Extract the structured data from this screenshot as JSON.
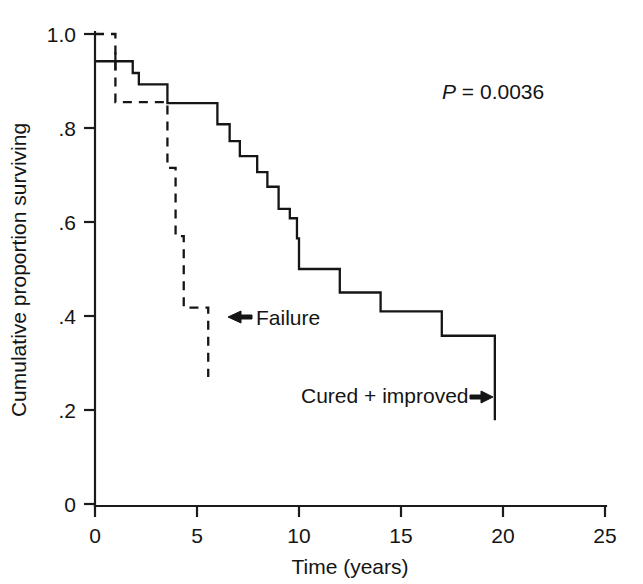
{
  "chart_data": {
    "type": "line",
    "subtype": "kaplan-meier-step",
    "title": "",
    "xlabel": "Time (years)",
    "ylabel": "Cumulative proportion surviving",
    "xlim": [
      0,
      25
    ],
    "ylim": [
      0,
      1.0
    ],
    "xticks": [
      0,
      5,
      10,
      15,
      20,
      25
    ],
    "xtick_labels": [
      "0",
      "5",
      "10",
      "15",
      "20",
      "25"
    ],
    "yticks": [
      0,
      0.2,
      0.4,
      0.6,
      0.8,
      1.0
    ],
    "ytick_labels": [
      "0",
      ".2",
      ".4",
      ".6",
      ".8",
      "1.0"
    ],
    "grid": false,
    "legend_position": "inline-annotations",
    "annotations": [
      {
        "name": "p-value",
        "text": "P = 0.0036",
        "italic_prefix": "P",
        "rest": " = 0.0036",
        "x": 16.4,
        "y": 0.885
      },
      {
        "name": "failure-label",
        "text": "Failure",
        "arrow": "left",
        "x": 7.3,
        "y": 0.415
      },
      {
        "name": "cured-improved-label",
        "text": "Cured + improved",
        "arrow": "right",
        "x": 14.6,
        "y": 0.235
      }
    ],
    "series": [
      {
        "name": "Cured + improved",
        "style": "solid",
        "color": "#151515",
        "steps": [
          {
            "t": 0.0,
            "s": 0.942
          },
          {
            "t": 1.85,
            "s": 0.942
          },
          {
            "t": 1.85,
            "s": 0.917
          },
          {
            "t": 2.15,
            "s": 0.917
          },
          {
            "t": 2.15,
            "s": 0.893
          },
          {
            "t": 3.55,
            "s": 0.893
          },
          {
            "t": 3.55,
            "s": 0.853
          },
          {
            "t": 6.0,
            "s": 0.853
          },
          {
            "t": 6.0,
            "s": 0.808
          },
          {
            "t": 6.6,
            "s": 0.808
          },
          {
            "t": 6.6,
            "s": 0.772
          },
          {
            "t": 7.1,
            "s": 0.772
          },
          {
            "t": 7.1,
            "s": 0.74
          },
          {
            "t": 7.95,
            "s": 0.74
          },
          {
            "t": 7.95,
            "s": 0.706
          },
          {
            "t": 8.45,
            "s": 0.706
          },
          {
            "t": 8.45,
            "s": 0.675
          },
          {
            "t": 9.0,
            "s": 0.675
          },
          {
            "t": 9.0,
            "s": 0.628
          },
          {
            "t": 9.55,
            "s": 0.628
          },
          {
            "t": 9.55,
            "s": 0.608
          },
          {
            "t": 9.9,
            "s": 0.608
          },
          {
            "t": 9.9,
            "s": 0.565
          },
          {
            "t": 10.0,
            "s": 0.565
          },
          {
            "t": 10.0,
            "s": 0.5
          },
          {
            "t": 12.0,
            "s": 0.5
          },
          {
            "t": 12.0,
            "s": 0.45
          },
          {
            "t": 14.0,
            "s": 0.45
          },
          {
            "t": 14.0,
            "s": 0.41
          },
          {
            "t": 17.0,
            "s": 0.41
          },
          {
            "t": 17.0,
            "s": 0.358
          },
          {
            "t": 19.6,
            "s": 0.358
          },
          {
            "t": 19.6,
            "s": 0.178
          }
        ],
        "censor_marks": [
          {
            "t": 1.0,
            "s": 0.942
          }
        ]
      },
      {
        "name": "Failure",
        "style": "dashed",
        "color": "#151515",
        "steps": [
          {
            "t": 0.0,
            "s": 1.0
          },
          {
            "t": 1.0,
            "s": 1.0
          },
          {
            "t": 1.0,
            "s": 0.855
          },
          {
            "t": 3.55,
            "s": 0.855
          },
          {
            "t": 3.55,
            "s": 0.715
          },
          {
            "t": 3.95,
            "s": 0.715
          },
          {
            "t": 3.95,
            "s": 0.57
          },
          {
            "t": 4.35,
            "s": 0.57
          },
          {
            "t": 4.35,
            "s": 0.418
          },
          {
            "t": 5.55,
            "s": 0.418
          },
          {
            "t": 5.55,
            "s": 0.27
          }
        ],
        "censor_marks": []
      }
    ]
  },
  "figure": {
    "background_color": "#ffffff",
    "line_color": "#151515",
    "axis_color": "#1b1b1b"
  }
}
